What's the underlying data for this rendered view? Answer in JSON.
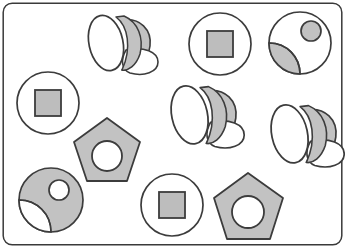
{
  "canvas": {
    "width": 345,
    "height": 248,
    "background_color": "#ffffff",
    "frame": {
      "name": "rounded-rectangle-border",
      "x": 3,
      "y": 3,
      "width": 339,
      "height": 242,
      "corner_radius": 9,
      "stroke_color": "#3a3a3a",
      "stroke_width": 1.4,
      "fill_color": "#ffffff"
    }
  },
  "palette": {
    "shape_fill_gray": "#c2c2c2",
    "shape_fill_gray_dark": "#bdbdbd",
    "shape_outline": "#3c3c3c",
    "white": "#ffffff"
  },
  "legend": {
    "shape_kinds": [
      "cone",
      "circle-with-square",
      "circle-with-petal-and-dot",
      "pentagon-with-circle"
    ]
  },
  "counts": {
    "cone": 3,
    "circle_with_square": 3,
    "circle_with_petal_and_dot": 2,
    "pentagon_with_circle": 2,
    "total": 10
  },
  "shapes": [
    {
      "id": "cone-1",
      "kind": "cone",
      "label": "cone",
      "cx": 114,
      "cy": 44,
      "scale": 1.0,
      "rotation": 0
    },
    {
      "id": "circle-square-1",
      "kind": "circle-with-square",
      "label": "circle with square",
      "cx": 220,
      "cy": 44,
      "radius": 31,
      "square_size": 26,
      "fill": "#bdbdbd"
    },
    {
      "id": "circle-petal-dot-1",
      "kind": "circle-with-petal-and-dot",
      "label": "circle with petal and dot",
      "cx": 300,
      "cy": 43,
      "radius": 31,
      "inverted": false,
      "dot_radius": 10
    },
    {
      "id": "circle-square-2",
      "kind": "circle-with-square",
      "label": "circle with square",
      "cx": 48,
      "cy": 103,
      "radius": 31,
      "square_size": 26,
      "fill": "#bdbdbd"
    },
    {
      "id": "cone-2",
      "kind": "cone",
      "label": "cone",
      "cx": 198,
      "cy": 116,
      "scale": 1.05,
      "rotation": 0
    },
    {
      "id": "cone-3",
      "kind": "cone",
      "label": "cone",
      "cx": 298,
      "cy": 135,
      "scale": 1.05,
      "rotation": 0
    },
    {
      "id": "pentagon-1",
      "kind": "pentagon-with-circle",
      "label": "pentagon with circle",
      "cx": 107,
      "cy": 152,
      "radius": 34,
      "hole_radius": 15
    },
    {
      "id": "circle-petal-dot-2",
      "kind": "circle-with-petal-and-dot",
      "label": "circle with petal and dot",
      "cx": 51,
      "cy": 200,
      "radius": 32,
      "inverted": true,
      "dot_radius": 10
    },
    {
      "id": "circle-square-3",
      "kind": "circle-with-square",
      "label": "circle with square",
      "cx": 172,
      "cy": 205,
      "radius": 31,
      "square_size": 26,
      "fill": "#bdbdbd"
    },
    {
      "id": "pentagon-2",
      "kind": "pentagon-with-circle",
      "label": "pentagon with circle",
      "cx": 248,
      "cy": 208,
      "radius": 35,
      "hole_radius": 16
    }
  ]
}
